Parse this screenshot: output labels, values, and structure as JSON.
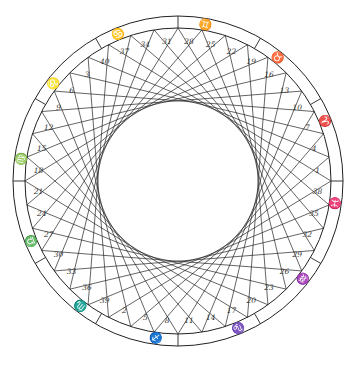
{
  "diagram": {
    "center": [
      178,
      181
    ],
    "outer_radius": 165,
    "ring_inner_radius": 153,
    "point_count": 40,
    "chord_step": 13,
    "start_angle_deg": -90,
    "line_color": "#222222",
    "numbers": [
      {
        "label": "1",
        "angle": -4.5
      },
      {
        "label": "4",
        "angle": -13.5
      },
      {
        "label": "7",
        "angle": -22.5
      },
      {
        "label": "10",
        "angle": -31.5
      },
      {
        "label": "13",
        "angle": -40.5
      },
      {
        "label": "16",
        "angle": -49.5
      },
      {
        "label": "19",
        "angle": -58.5
      },
      {
        "label": "22",
        "angle": -67.5
      },
      {
        "label": "25",
        "angle": -76.5
      },
      {
        "label": "28",
        "angle": -85.5
      },
      {
        "label": "31",
        "angle": -94.5
      },
      {
        "label": "34",
        "angle": -103.5
      },
      {
        "label": "37",
        "angle": -112.5
      },
      {
        "label": "40",
        "angle": -121.5
      },
      {
        "label": "3",
        "angle": -130.5
      },
      {
        "label": "6",
        "angle": -139.5
      },
      {
        "label": "9",
        "angle": -148.5
      },
      {
        "label": "12",
        "angle": -157.5
      },
      {
        "label": "15",
        "angle": -166.5
      },
      {
        "label": "18",
        "angle": -175.5
      },
      {
        "label": "21",
        "angle": 175.5
      },
      {
        "label": "24",
        "angle": 166.5
      },
      {
        "label": "27",
        "angle": 157.5
      },
      {
        "label": "30",
        "angle": 148.5
      },
      {
        "label": "33",
        "angle": 139.5
      },
      {
        "label": "36",
        "angle": 130.5
      },
      {
        "label": "39",
        "angle": 121.5
      },
      {
        "label": "2",
        "angle": 112.5
      },
      {
        "label": "5",
        "angle": 103.5
      },
      {
        "label": "8",
        "angle": 94.5
      },
      {
        "label": "11",
        "angle": 85.5
      },
      {
        "label": "14",
        "angle": 76.5
      },
      {
        "label": "17",
        "angle": 67.5
      },
      {
        "label": "20",
        "angle": 58.5
      },
      {
        "label": "23",
        "angle": 49.5
      },
      {
        "label": "26",
        "angle": 40.5
      },
      {
        "label": "29",
        "angle": 31.5
      },
      {
        "label": "32",
        "angle": 22.5
      },
      {
        "label": "35",
        "angle": 13.5
      },
      {
        "label": "38",
        "angle": 4.5
      }
    ],
    "signs": [
      {
        "name": "cancer",
        "glyph": "♋",
        "angle": -112
      },
      {
        "name": "gemini",
        "glyph": "♊",
        "angle": -80
      },
      {
        "name": "taurus",
        "glyph": "♉",
        "angle": -51
      },
      {
        "name": "aries",
        "glyph": "♈",
        "angle": -22
      },
      {
        "name": "pisces",
        "glyph": "♓",
        "angle": 8
      },
      {
        "name": "aquarius",
        "glyph": "♒",
        "angle": 38
      },
      {
        "name": "capricorn",
        "glyph": "♑",
        "angle": 68
      },
      {
        "name": "sagittarius",
        "glyph": "♐",
        "angle": 98
      },
      {
        "name": "scorpio",
        "glyph": "♏",
        "angle": 128
      },
      {
        "name": "libra",
        "glyph": "♎",
        "angle": 158
      },
      {
        "name": "virgo",
        "glyph": "♍",
        "angle": 188
      },
      {
        "name": "leo",
        "glyph": "♌",
        "angle": 218
      }
    ],
    "sign_dividers_deg": [
      -90,
      -60,
      -30,
      0,
      30,
      60,
      90,
      120,
      150,
      180,
      210,
      240
    ]
  }
}
